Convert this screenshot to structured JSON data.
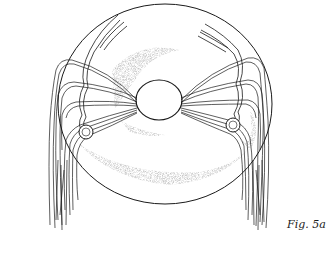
{
  "figure": {
    "caption": "Fig. 5a",
    "colors": {
      "ink": "#1a1a1a",
      "paper": "#ffffff",
      "stipple": "#9a9a9a"
    }
  }
}
